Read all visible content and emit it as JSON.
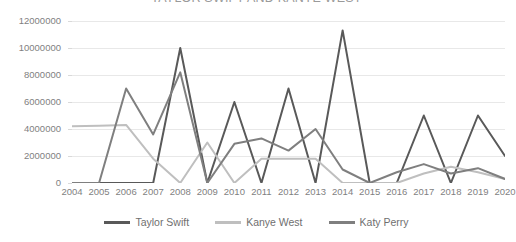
{
  "chart_data": {
    "type": "line",
    "title": "TAYLOR SWIFT AND KANYE WEST",
    "xlabel": "",
    "ylabel": "",
    "categories": [
      "2004",
      "2005",
      "2006",
      "2007",
      "2008",
      "2009",
      "2010",
      "2011",
      "2012",
      "2013",
      "2014",
      "2015",
      "2016",
      "2017",
      "2018",
      "2019",
      "2020"
    ],
    "ylim": [
      0,
      12000000
    ],
    "ytick_step": 2000000,
    "ytick_labels": [
      "0",
      "2000000",
      "4000000",
      "6000000",
      "8000000",
      "10000000",
      "12000000"
    ],
    "grid": true,
    "legend_position": "bottom",
    "series": [
      {
        "name": "Taylor Swift",
        "color": "#595959",
        "values": [
          0,
          0,
          0,
          0,
          10000000,
          0,
          6000000,
          0,
          7000000,
          0,
          11300000,
          0,
          0,
          5000000,
          0,
          5000000,
          2000000
        ]
      },
      {
        "name": "Kanye West",
        "color": "#bfbfbf",
        "values": [
          4200000,
          4250000,
          4300000,
          1800000,
          0,
          3000000,
          0,
          1800000,
          1800000,
          1800000,
          0,
          0,
          0,
          700000,
          1200000,
          800000,
          300000
        ]
      },
      {
        "name": "Katy Perry",
        "color": "#7f7f7f",
        "values": [
          0,
          0,
          7000000,
          3600000,
          8200000,
          0,
          2900000,
          3300000,
          2400000,
          4000000,
          1000000,
          0,
          800000,
          1400000,
          700000,
          1100000,
          300000
        ]
      }
    ]
  },
  "legend": {
    "items": [
      {
        "label": "Taylor Swift"
      },
      {
        "label": "Kanye West"
      },
      {
        "label": "Katy Perry"
      }
    ]
  }
}
